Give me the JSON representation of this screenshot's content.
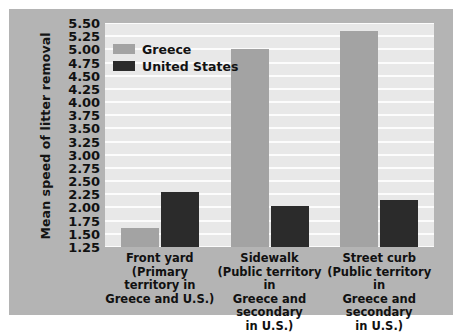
{
  "chart_data": {
    "type": "bar",
    "title": "",
    "xlabel": "",
    "ylabel": "Mean speed of litter removal",
    "ylim": [
      1.25,
      5.5
    ],
    "ytick_step": 0.25,
    "yticks": [
      "5.50",
      "5.25",
      "5.00",
      "4.75",
      "4.50",
      "4.25",
      "4.00",
      "3.75",
      "3.50",
      "3.25",
      "3.00",
      "2.75",
      "2.50",
      "2.25",
      "2.00",
      "1.75",
      "1.50",
      "1.25"
    ],
    "grid": true,
    "legend_position": "top-left",
    "categories": [
      "Front yard",
      "Sidewalk",
      "Street curb"
    ],
    "category_sublabels": [
      [
        "(Primary territory in",
        "Greece and U.S.)"
      ],
      [
        "(Public territory in",
        "Greece and secondary",
        "in U.S.)"
      ],
      [
        "(Public territory in",
        "Greece and secondary",
        "in U.S.)"
      ]
    ],
    "series": [
      {
        "name": "Greece",
        "color": "#a3a3a3",
        "values": [
          1.62,
          5.0,
          5.35
        ]
      },
      {
        "name": "United States",
        "color": "#2b2b2b",
        "values": [
          2.3,
          2.02,
          2.15
        ]
      }
    ]
  },
  "legend": {
    "items": [
      {
        "label": "Greece"
      },
      {
        "label": "United States"
      }
    ]
  },
  "colors": {
    "figure_background": "#b4b4b4",
    "plot_background": "#e8e8e8",
    "gridline": "#fcfcfc",
    "greece": "#a3a3a3",
    "united_states": "#2b2b2b",
    "text": "#111111"
  }
}
